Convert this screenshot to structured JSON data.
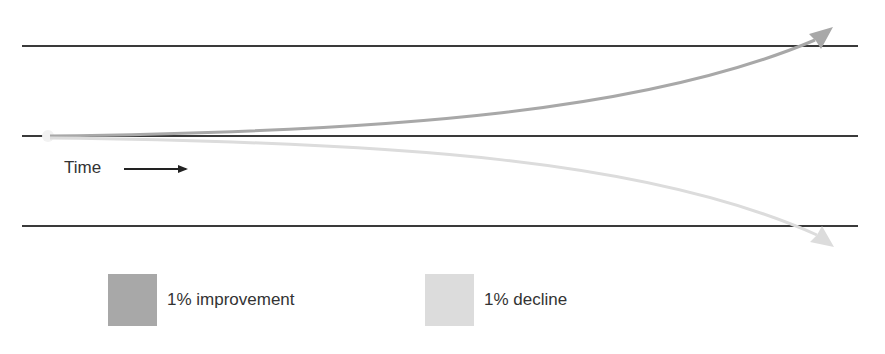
{
  "diagram": {
    "title": "",
    "axis_label": "Time",
    "colors": {
      "baseline": "#3a3a3a",
      "improvement": "#a8a8a8",
      "decline": "#dcdcdc"
    }
  },
  "legend": {
    "items": [
      {
        "label": "1% improvement",
        "color": "#a8a8a8"
      },
      {
        "label": "1% decline",
        "color": "#dcdcdc"
      }
    ]
  }
}
